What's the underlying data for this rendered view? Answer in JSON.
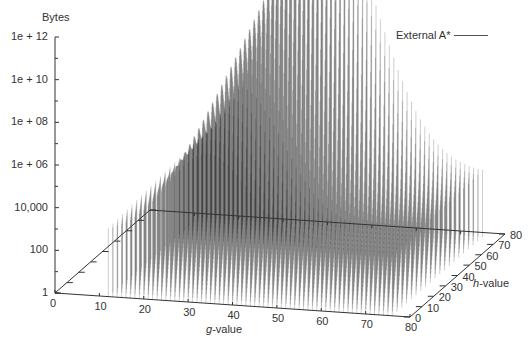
{
  "chart_data": {
    "type": "3d-impulse",
    "title": "",
    "zlabel": "Bytes",
    "xlabel": "g-value",
    "ylabel": "h-value",
    "z_scale": "log",
    "z_ticks": [
      "1",
      "100",
      "10,000",
      "1e + 06",
      "1e + 08",
      "1e + 10",
      "1e + 12"
    ],
    "z_tick_values": [
      1,
      100,
      10000,
      1000000,
      100000000,
      10000000000,
      1000000000000
    ],
    "x_ticks": [
      "0",
      "10",
      "20",
      "30",
      "40",
      "50",
      "60",
      "70",
      "80"
    ],
    "y_ticks": [
      "0",
      "10",
      "20",
      "30",
      "40",
      "50",
      "60",
      "70",
      "80"
    ],
    "xlim": [
      0,
      80
    ],
    "ylim": [
      0,
      80
    ],
    "zlim": [
      1,
      1000000000000
    ],
    "grid": false,
    "legend": {
      "position": "top-right",
      "entries": [
        "External A*"
      ]
    },
    "series": [
      {
        "name": "External A*",
        "description": "Impulse (vertical line) plot of bytes per (g,h) bucket; bell-shaped envelope over g, peaking near g≈40 at ~1e+12 bytes for high h, with values starting around 1e+03–1e+05 near g≈12–20 and tapering to ~1e+03 near g≈75",
        "peak": {
          "g": 40,
          "h": 75,
          "bytes": 1000000000000
        },
        "g_range_with_data": [
          12,
          76
        ],
        "envelope_samples": [
          {
            "g": 12,
            "bytes": 10000
          },
          {
            "g": 20,
            "bytes": 10000000
          },
          {
            "g": 30,
            "bytes": 10000000000
          },
          {
            "g": 40,
            "bytes": 1000000000000
          },
          {
            "g": 50,
            "bytes": 100000000000
          },
          {
            "g": 60,
            "bytes": 1000000000
          },
          {
            "g": 70,
            "bytes": 10000000
          },
          {
            "g": 76,
            "bytes": 10000
          }
        ]
      }
    ]
  },
  "labels": {
    "zlabel": "Bytes",
    "xlabel_italic": "g",
    "xlabel_rest": "-value",
    "ylabel_italic": "h",
    "ylabel_rest": "-value",
    "legend_entry": "External A*"
  },
  "colors": {
    "axis": "#333333",
    "impulse": "#000000",
    "background": "#ffffff"
  }
}
